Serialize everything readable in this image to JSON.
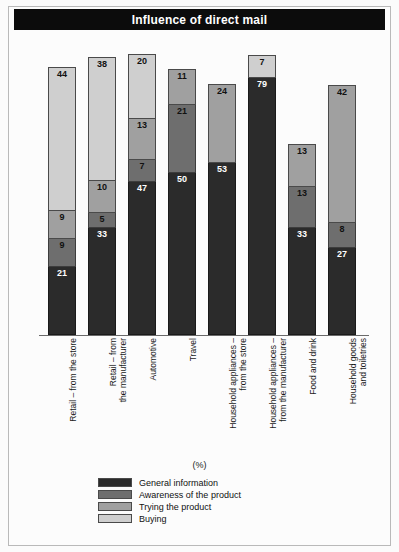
{
  "title": "Influence of direct mail",
  "axis_unit_label": "(%)",
  "legend": {
    "items": [
      {
        "label": "General information",
        "color": "#2b2b2b"
      },
      {
        "label": "Awareness of the product",
        "color": "#6e6e6e"
      },
      {
        "label": "Trying the product",
        "color": "#a0a0a0"
      },
      {
        "label": "Buying",
        "color": "#cfcfcf"
      }
    ]
  },
  "chart_data": {
    "type": "bar",
    "subtype": "stacked-vertical",
    "title": "Influence of direct mail",
    "xlabel": "",
    "ylabel": "(%)",
    "ylim": [
      0,
      90
    ],
    "grid": false,
    "legend_position": "bottom",
    "categories": [
      "Retail – from the store",
      "Retail – from\nthe manufacturer",
      "Automotive",
      "Travel",
      "Household appliances –\nfrom the store",
      "Household appliances –\nfrom the manufacturer",
      "Food and drink",
      "Household goods\nand toiletries"
    ],
    "series": [
      {
        "name": "General information",
        "color": "#2b2b2b",
        "values": [
          21,
          33,
          47,
          50,
          53,
          79,
          33,
          27
        ]
      },
      {
        "name": "Awareness of the product",
        "color": "#6e6e6e",
        "values": [
          9,
          5,
          7,
          21,
          0,
          0,
          13,
          8
        ]
      },
      {
        "name": "Trying the product",
        "color": "#a0a0a0",
        "values": [
          9,
          10,
          13,
          11,
          24,
          0,
          13,
          42
        ]
      },
      {
        "name": "Buying",
        "color": "#cfcfcf",
        "values": [
          44,
          38,
          20,
          0,
          0,
          7,
          0,
          0
        ]
      }
    ],
    "totals": [
      83,
      86,
      87,
      82,
      77,
      86,
      59,
      77
    ]
  }
}
